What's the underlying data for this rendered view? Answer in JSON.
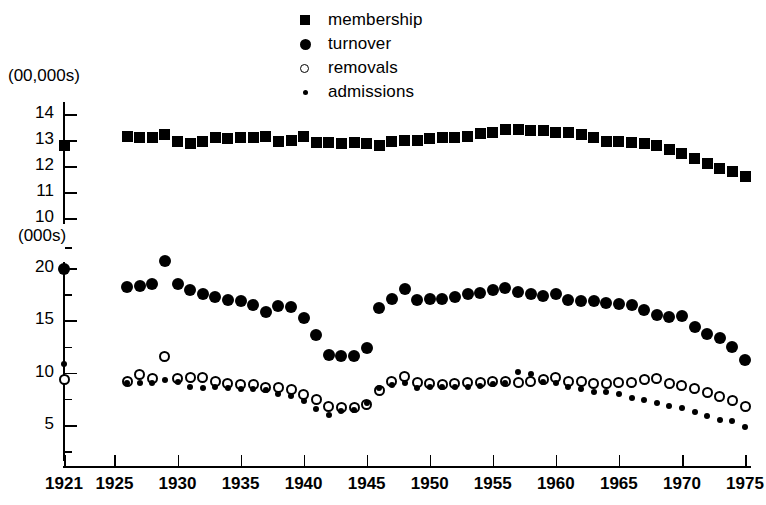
{
  "chart_data": {
    "type": "scatter",
    "title": "",
    "xlabel": "",
    "ylabel": "",
    "grid": false,
    "legend_position": "top-center",
    "axes": {
      "upper": {
        "unit_label": "(00,000s)",
        "ticks": [
          14,
          13,
          12,
          11,
          10
        ],
        "ylim": [
          9.6,
          14.4
        ],
        "applies_to": [
          "membership"
        ]
      },
      "lower": {
        "unit_label": "(000s)",
        "ticks": [
          20,
          15,
          10,
          5
        ],
        "minor_ticks": [
          17.5,
          12.5,
          7.5,
          2.5
        ],
        "ylim": [
          1.5,
          21.0
        ],
        "applies_to": [
          "turnover",
          "removals",
          "admissions"
        ]
      }
    },
    "x": [
      1921,
      1926,
      1927,
      1928,
      1929,
      1930,
      1931,
      1932,
      1933,
      1934,
      1935,
      1936,
      1937,
      1938,
      1939,
      1940,
      1941,
      1942,
      1943,
      1944,
      1945,
      1946,
      1947,
      1948,
      1949,
      1950,
      1951,
      1952,
      1953,
      1954,
      1955,
      1956,
      1957,
      1958,
      1959,
      1960,
      1961,
      1962,
      1963,
      1964,
      1965,
      1966,
      1967,
      1968,
      1969,
      1970,
      1971,
      1972,
      1973,
      1974,
      1975
    ],
    "xtick_labels": [
      "1921",
      "1925",
      "1930",
      "1935",
      "1940",
      "1945",
      "1950",
      "1955",
      "1960",
      "1965",
      "1970",
      "1975"
    ],
    "xticks": [
      1921,
      1925,
      1930,
      1935,
      1940,
      1945,
      1950,
      1955,
      1960,
      1965,
      1970,
      1975
    ],
    "xlim": [
      1919.5,
      1976.5
    ],
    "series": [
      {
        "name": "membership",
        "marker": "filled-square",
        "axis": "upper",
        "points": [
          {
            "x": 1921,
            "y": 12.8
          },
          {
            "x": 1926,
            "y": 13.15
          },
          {
            "x": 1927,
            "y": 13.1
          },
          {
            "x": 1928,
            "y": 13.1
          },
          {
            "x": 1929,
            "y": 13.2
          },
          {
            "x": 1930,
            "y": 12.95
          },
          {
            "x": 1931,
            "y": 12.85
          },
          {
            "x": 1932,
            "y": 12.95
          },
          {
            "x": 1933,
            "y": 13.1
          },
          {
            "x": 1934,
            "y": 13.05
          },
          {
            "x": 1935,
            "y": 13.1
          },
          {
            "x": 1936,
            "y": 13.1
          },
          {
            "x": 1937,
            "y": 13.15
          },
          {
            "x": 1938,
            "y": 12.95
          },
          {
            "x": 1939,
            "y": 13.0
          },
          {
            "x": 1940,
            "y": 13.15
          },
          {
            "x": 1941,
            "y": 12.9
          },
          {
            "x": 1942,
            "y": 12.9
          },
          {
            "x": 1943,
            "y": 12.85
          },
          {
            "x": 1944,
            "y": 12.9
          },
          {
            "x": 1945,
            "y": 12.85
          },
          {
            "x": 1946,
            "y": 12.8
          },
          {
            "x": 1947,
            "y": 12.95
          },
          {
            "x": 1948,
            "y": 13.0
          },
          {
            "x": 1949,
            "y": 13.0
          },
          {
            "x": 1950,
            "y": 13.05
          },
          {
            "x": 1951,
            "y": 13.1
          },
          {
            "x": 1952,
            "y": 13.1
          },
          {
            "x": 1953,
            "y": 13.15
          },
          {
            "x": 1954,
            "y": 13.25
          },
          {
            "x": 1955,
            "y": 13.3
          },
          {
            "x": 1956,
            "y": 13.4
          },
          {
            "x": 1957,
            "y": 13.4
          },
          {
            "x": 1958,
            "y": 13.35
          },
          {
            "x": 1959,
            "y": 13.35
          },
          {
            "x": 1960,
            "y": 13.3
          },
          {
            "x": 1961,
            "y": 13.3
          },
          {
            "x": 1962,
            "y": 13.2
          },
          {
            "x": 1963,
            "y": 13.1
          },
          {
            "x": 1964,
            "y": 12.95
          },
          {
            "x": 1965,
            "y": 12.95
          },
          {
            "x": 1966,
            "y": 12.9
          },
          {
            "x": 1967,
            "y": 12.85
          },
          {
            "x": 1968,
            "y": 12.8
          },
          {
            "x": 1969,
            "y": 12.65
          },
          {
            "x": 1970,
            "y": 12.5
          },
          {
            "x": 1971,
            "y": 12.3
          },
          {
            "x": 1972,
            "y": 12.1
          },
          {
            "x": 1973,
            "y": 11.9
          },
          {
            "x": 1974,
            "y": 11.8
          },
          {
            "x": 1975,
            "y": 11.6
          }
        ]
      },
      {
        "name": "turnover",
        "marker": "filled-circle",
        "axis": "lower",
        "points": [
          {
            "x": 1921,
            "y": 19.9
          },
          {
            "x": 1926,
            "y": 18.2
          },
          {
            "x": 1927,
            "y": 18.3
          },
          {
            "x": 1928,
            "y": 18.5
          },
          {
            "x": 1929,
            "y": 20.7
          },
          {
            "x": 1930,
            "y": 18.5
          },
          {
            "x": 1931,
            "y": 17.9
          },
          {
            "x": 1932,
            "y": 17.5
          },
          {
            "x": 1933,
            "y": 17.2
          },
          {
            "x": 1934,
            "y": 16.9
          },
          {
            "x": 1935,
            "y": 16.8
          },
          {
            "x": 1936,
            "y": 16.5
          },
          {
            "x": 1937,
            "y": 15.8
          },
          {
            "x": 1938,
            "y": 16.4
          },
          {
            "x": 1939,
            "y": 16.3
          },
          {
            "x": 1940,
            "y": 15.2
          },
          {
            "x": 1941,
            "y": 13.6
          },
          {
            "x": 1942,
            "y": 11.7
          },
          {
            "x": 1943,
            "y": 11.6
          },
          {
            "x": 1944,
            "y": 11.6
          },
          {
            "x": 1945,
            "y": 12.4
          },
          {
            "x": 1946,
            "y": 16.2
          },
          {
            "x": 1947,
            "y": 17.0
          },
          {
            "x": 1948,
            "y": 18.0
          },
          {
            "x": 1949,
            "y": 16.9
          },
          {
            "x": 1950,
            "y": 17.0
          },
          {
            "x": 1951,
            "y": 17.0
          },
          {
            "x": 1952,
            "y": 17.2
          },
          {
            "x": 1953,
            "y": 17.5
          },
          {
            "x": 1954,
            "y": 17.6
          },
          {
            "x": 1955,
            "y": 17.9
          },
          {
            "x": 1956,
            "y": 18.1
          },
          {
            "x": 1957,
            "y": 17.7
          },
          {
            "x": 1958,
            "y": 17.5
          },
          {
            "x": 1959,
            "y": 17.3
          },
          {
            "x": 1960,
            "y": 17.5
          },
          {
            "x": 1961,
            "y": 16.9
          },
          {
            "x": 1962,
            "y": 16.8
          },
          {
            "x": 1963,
            "y": 16.8
          },
          {
            "x": 1964,
            "y": 16.7
          },
          {
            "x": 1965,
            "y": 16.6
          },
          {
            "x": 1966,
            "y": 16.5
          },
          {
            "x": 1967,
            "y": 16.0
          },
          {
            "x": 1968,
            "y": 15.5
          },
          {
            "x": 1969,
            "y": 15.3
          },
          {
            "x": 1970,
            "y": 15.4
          },
          {
            "x": 1971,
            "y": 14.4
          },
          {
            "x": 1972,
            "y": 13.7
          },
          {
            "x": 1973,
            "y": 13.3
          },
          {
            "x": 1974,
            "y": 12.5
          },
          {
            "x": 1975,
            "y": 11.2
          }
        ]
      },
      {
        "name": "removals",
        "marker": "open-circle",
        "axis": "lower",
        "points": [
          {
            "x": 1921,
            "y": 9.3
          },
          {
            "x": 1926,
            "y": 9.2
          },
          {
            "x": 1927,
            "y": 9.8
          },
          {
            "x": 1928,
            "y": 9.4
          },
          {
            "x": 1929,
            "y": 11.5
          },
          {
            "x": 1930,
            "y": 9.4
          },
          {
            "x": 1931,
            "y": 9.5
          },
          {
            "x": 1932,
            "y": 9.5
          },
          {
            "x": 1933,
            "y": 9.2
          },
          {
            "x": 1934,
            "y": 9.0
          },
          {
            "x": 1935,
            "y": 8.9
          },
          {
            "x": 1936,
            "y": 8.9
          },
          {
            "x": 1937,
            "y": 8.6
          },
          {
            "x": 1938,
            "y": 8.6
          },
          {
            "x": 1939,
            "y": 8.4
          },
          {
            "x": 1940,
            "y": 7.9
          },
          {
            "x": 1941,
            "y": 7.4
          },
          {
            "x": 1942,
            "y": 6.8
          },
          {
            "x": 1943,
            "y": 6.7
          },
          {
            "x": 1944,
            "y": 6.7
          },
          {
            "x": 1945,
            "y": 7.0
          },
          {
            "x": 1946,
            "y": 8.3
          },
          {
            "x": 1947,
            "y": 9.2
          },
          {
            "x": 1948,
            "y": 9.6
          },
          {
            "x": 1949,
            "y": 9.1
          },
          {
            "x": 1950,
            "y": 9.0
          },
          {
            "x": 1951,
            "y": 8.9
          },
          {
            "x": 1952,
            "y": 9.0
          },
          {
            "x": 1953,
            "y": 9.1
          },
          {
            "x": 1954,
            "y": 9.1
          },
          {
            "x": 1955,
            "y": 9.2
          },
          {
            "x": 1956,
            "y": 9.2
          },
          {
            "x": 1957,
            "y": 9.1
          },
          {
            "x": 1958,
            "y": 9.2
          },
          {
            "x": 1959,
            "y": 9.3
          },
          {
            "x": 1960,
            "y": 9.5
          },
          {
            "x": 1961,
            "y": 9.2
          },
          {
            "x": 1962,
            "y": 9.2
          },
          {
            "x": 1963,
            "y": 9.0
          },
          {
            "x": 1964,
            "y": 9.0
          },
          {
            "x": 1965,
            "y": 9.1
          },
          {
            "x": 1966,
            "y": 9.1
          },
          {
            "x": 1967,
            "y": 9.3
          },
          {
            "x": 1968,
            "y": 9.4
          },
          {
            "x": 1969,
            "y": 9.0
          },
          {
            "x": 1970,
            "y": 8.8
          },
          {
            "x": 1971,
            "y": 8.5
          },
          {
            "x": 1972,
            "y": 8.1
          },
          {
            "x": 1973,
            "y": 7.7
          },
          {
            "x": 1974,
            "y": 7.3
          },
          {
            "x": 1975,
            "y": 6.8
          }
        ]
      },
      {
        "name": "admissions",
        "marker": "small-dot",
        "axis": "lower",
        "points": [
          {
            "x": 1921,
            "y": 10.8
          },
          {
            "x": 1926,
            "y": 9.0
          },
          {
            "x": 1927,
            "y": 9.0
          },
          {
            "x": 1928,
            "y": 9.0
          },
          {
            "x": 1929,
            "y": 9.3
          },
          {
            "x": 1930,
            "y": 9.1
          },
          {
            "x": 1931,
            "y": 8.6
          },
          {
            "x": 1932,
            "y": 8.5
          },
          {
            "x": 1933,
            "y": 8.6
          },
          {
            "x": 1934,
            "y": 8.5
          },
          {
            "x": 1935,
            "y": 8.4
          },
          {
            "x": 1936,
            "y": 8.4
          },
          {
            "x": 1937,
            "y": 8.3
          },
          {
            "x": 1938,
            "y": 8.0
          },
          {
            "x": 1939,
            "y": 7.8
          },
          {
            "x": 1940,
            "y": 7.3
          },
          {
            "x": 1941,
            "y": 6.5
          },
          {
            "x": 1942,
            "y": 6.0
          },
          {
            "x": 1943,
            "y": 6.3
          },
          {
            "x": 1944,
            "y": 6.4
          },
          {
            "x": 1945,
            "y": 7.1
          },
          {
            "x": 1946,
            "y": 8.5
          },
          {
            "x": 1947,
            "y": 8.8
          },
          {
            "x": 1948,
            "y": 9.0
          },
          {
            "x": 1949,
            "y": 8.5
          },
          {
            "x": 1950,
            "y": 8.6
          },
          {
            "x": 1951,
            "y": 8.6
          },
          {
            "x": 1952,
            "y": 8.6
          },
          {
            "x": 1953,
            "y": 8.6
          },
          {
            "x": 1954,
            "y": 8.7
          },
          {
            "x": 1955,
            "y": 8.9
          },
          {
            "x": 1956,
            "y": 9.0
          },
          {
            "x": 1957,
            "y": 10.1
          },
          {
            "x": 1958,
            "y": 9.9
          },
          {
            "x": 1959,
            "y": 9.1
          },
          {
            "x": 1960,
            "y": 9.0
          },
          {
            "x": 1961,
            "y": 8.6
          },
          {
            "x": 1962,
            "y": 8.4
          },
          {
            "x": 1963,
            "y": 8.2
          },
          {
            "x": 1964,
            "y": 8.2
          },
          {
            "x": 1965,
            "y": 8.0
          },
          {
            "x": 1966,
            "y": 7.6
          },
          {
            "x": 1967,
            "y": 7.4
          },
          {
            "x": 1968,
            "y": 7.1
          },
          {
            "x": 1969,
            "y": 6.8
          },
          {
            "x": 1970,
            "y": 6.6
          },
          {
            "x": 1971,
            "y": 6.2
          },
          {
            "x": 1972,
            "y": 5.9
          },
          {
            "x": 1973,
            "y": 5.5
          },
          {
            "x": 1974,
            "y": 5.4
          },
          {
            "x": 1975,
            "y": 4.8
          }
        ]
      }
    ]
  },
  "legend": {
    "items": [
      {
        "label": "membership",
        "marker": "filled-square",
        "icon": "filled-square-icon"
      },
      {
        "label": "turnover",
        "marker": "filled-circle",
        "icon": "filled-circle-icon"
      },
      {
        "label": "removals",
        "marker": "open-circle",
        "icon": "open-circle-icon"
      },
      {
        "label": "admissions",
        "marker": "small-dot",
        "icon": "small-dot-icon"
      }
    ]
  }
}
